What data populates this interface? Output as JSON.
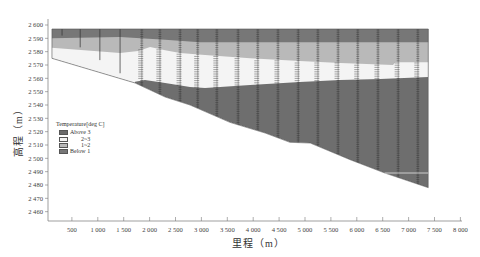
{
  "chart_data": {
    "type": "area",
    "title": "",
    "subtitle": "",
    "xlabel": "里程（m）",
    "ylabel": "高程（m）",
    "xlim": [
      0,
      8000
    ],
    "ylim": [
      2453,
      2604
    ],
    "grid": false,
    "xticks": [
      500,
      1000,
      1500,
      2000,
      2500,
      3000,
      3500,
      4000,
      4500,
      5000,
      5500,
      6000,
      6500,
      7000,
      7500,
      8000
    ],
    "xtick_labels": [
      "500",
      "1 000",
      "1 500",
      "2 000",
      "2 500",
      "3 000",
      "3 500",
      "4 000",
      "4 500",
      "5 000",
      "5 500",
      "6 000",
      "6 500",
      "7 000",
      "7 500",
      "8 000"
    ],
    "yticks": [
      2460,
      2470,
      2480,
      2490,
      2500,
      2510,
      2520,
      2530,
      2540,
      2550,
      2560,
      2570,
      2580,
      2590,
      2600
    ],
    "ytick_labels": [
      "2 460",
      "2 470",
      "2 480",
      "2 490",
      "2 500",
      "2 510",
      "2 520",
      "2 530",
      "2 540",
      "2 550",
      "2 560",
      "2 570",
      "2 580",
      "2 590",
      "2 600"
    ],
    "legend": {
      "title": "Temperature[deg C]",
      "position": "inside-left",
      "entries": [
        {
          "label": "Above 3",
          "color": "#6b6b6b",
          "indent": false
        },
        {
          "label": "2~3",
          "color": "#f4f4f4",
          "indent": true
        },
        {
          "label": "1~2",
          "color": "#b9b9b9",
          "indent": true
        },
        {
          "label": "Below 1",
          "color": "#777777",
          "indent": false
        }
      ]
    },
    "section_outline": [
      [
        115,
        2597
      ],
      [
        7380,
        2597
      ],
      [
        7380,
        2478
      ],
      [
        6540,
        2489
      ],
      [
        5870,
        2499
      ],
      [
        5100,
        2511.5
      ],
      [
        4710,
        2512
      ],
      [
        4230,
        2519
      ],
      [
        3550,
        2527
      ],
      [
        2780,
        2540
      ],
      [
        2300,
        2546
      ],
      [
        1720,
        2556.5
      ],
      [
        115,
        2575
      ]
    ],
    "layers": [
      {
        "name": "Above 3",
        "color": "#6e6e6e",
        "lower_boundary": null
      },
      {
        "name": "2~3",
        "color": "#f4f4f4",
        "lower_boundary": [
          [
            0,
            2540
          ],
          [
            1690,
            2550
          ],
          [
            1720,
            2557.5
          ],
          [
            1910,
            2558.7
          ],
          [
            2300,
            2556.5
          ],
          [
            2780,
            2553.5
          ],
          [
            3070,
            2552.7
          ],
          [
            3360,
            2553.5
          ],
          [
            3940,
            2555
          ],
          [
            4900,
            2557.2
          ],
          [
            5680,
            2558.7
          ],
          [
            6450,
            2559.5
          ],
          [
            7380,
            2561
          ]
        ]
      },
      {
        "name": "1~2",
        "color": "#b9b9b9",
        "lower_boundary": [
          [
            110,
            2583
          ],
          [
            1430,
            2579
          ],
          [
            1780,
            2580.5
          ],
          [
            2010,
            2583.5
          ],
          [
            2300,
            2581
          ],
          [
            2590,
            2579
          ],
          [
            3070,
            2577.5
          ],
          [
            3940,
            2575
          ],
          [
            4900,
            2573
          ],
          [
            5680,
            2571.5
          ],
          [
            6700,
            2570
          ],
          [
            6740,
            2572
          ],
          [
            7380,
            2572
          ]
        ]
      },
      {
        "name": "Below 1",
        "color": "#777777",
        "lower_boundary": [
          [
            110,
            2590
          ],
          [
            1430,
            2591
          ],
          [
            2300,
            2589
          ],
          [
            2970,
            2587
          ],
          [
            7380,
            2587
          ]
        ]
      }
    ],
    "profiles_x": [
      310,
      660,
      1040,
      1430,
      1850,
      2200,
      2590,
      2930,
      3300,
      3710,
      4090,
      4480,
      4870,
      5250,
      5640,
      6020,
      6410,
      6800,
      7180
    ],
    "annotation_line": {
      "from": [
        6540,
        2489
      ],
      "to": [
        7380,
        2489
      ],
      "color": "#e6e6e6"
    }
  }
}
